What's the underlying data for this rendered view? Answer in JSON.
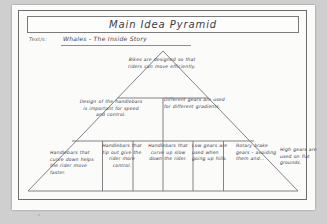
{
  "worksheet": {
    "title": "Main Idea Pyramid",
    "topic_label": "Text/s:",
    "topic_value": "Whales - The Inside Story"
  },
  "pyramid": {
    "tier1": [
      {
        "id": "apex",
        "text": "Bikes are designed so that riders can move efficiently."
      }
    ],
    "tier2": [
      {
        "id": "middle-left",
        "text": "Design of the handlebars is important for speed and control."
      },
      {
        "id": "middle-right",
        "text": "Different gears are used for different gradients."
      }
    ],
    "tier3": [
      {
        "id": "base-1",
        "text": "Handlebars that curve down helps the rider move faster."
      },
      {
        "id": "base-2",
        "text": "Handlebars that tip out give the rider more control."
      },
      {
        "id": "base-3",
        "text": "Handlebars that curve up slow down the rider."
      },
      {
        "id": "base-4",
        "text": "Low gears are used when going up hills."
      },
      {
        "id": "base-5",
        "text": "Rotary brake gears - avoiding them and..."
      },
      {
        "id": "base-6",
        "text": "High gears are used on flat grounds."
      }
    ]
  },
  "colors": {
    "paper": "#fbfbf9",
    "ink": "#3e3e4a",
    "rule": "#6e6e6e",
    "backdrop": "#cfcfcf"
  }
}
